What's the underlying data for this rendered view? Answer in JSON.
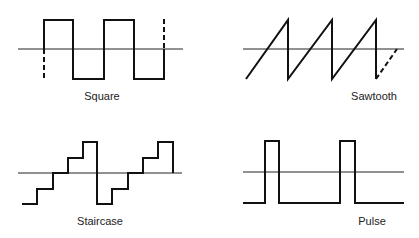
{
  "colors": {
    "stroke": "#111111",
    "axis": "#222222",
    "background": "#ffffff"
  },
  "panels": [
    {
      "id": "square",
      "label": "Square"
    },
    {
      "id": "sawtooth",
      "label": "Sawtooth"
    },
    {
      "id": "staircase",
      "label": "Staircase"
    },
    {
      "id": "pulse",
      "label": "Pulse"
    }
  ]
}
